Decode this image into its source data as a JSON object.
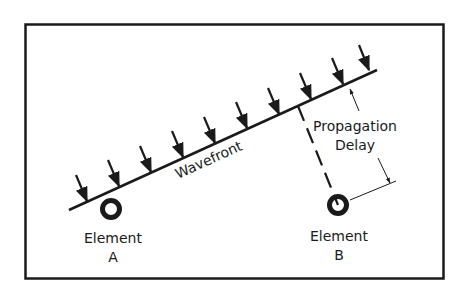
{
  "diagram": {
    "wavefront_label": "Wavefront",
    "delay_label_line1": "Propagation",
    "delay_label_line2": "Delay",
    "element_a": {
      "line1": "Element",
      "line2": "A"
    },
    "element_b": {
      "line1": "Element",
      "line2": "B"
    },
    "arrow_count": 9,
    "colors": {
      "ink": "#1a1a1a",
      "background": "#ffffff"
    }
  }
}
